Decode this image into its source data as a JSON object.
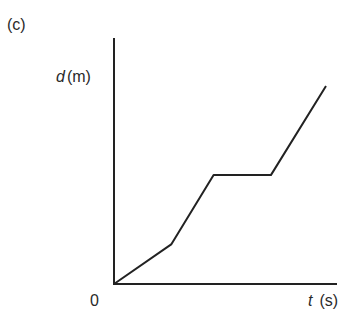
{
  "panel_label": "(c)",
  "chart_data": {
    "type": "line",
    "title": "",
    "xlabel_var": "t",
    "xlabel_unit": "(s)",
    "ylabel_var": "d",
    "ylabel_unit": "(m)",
    "origin_label": "0",
    "grid": false,
    "legend": null,
    "units": "relative (no tick values shown)",
    "x": [
      0,
      0.27,
      0.47,
      0.74,
      1.0
    ],
    "y": [
      0,
      0.2,
      0.55,
      0.55,
      1.0
    ],
    "xlim": [
      0,
      1.1
    ],
    "ylim": [
      0,
      1.25
    ],
    "segments": [
      "slow constant speed",
      "faster constant speed",
      "stationary (flat)",
      "fastest constant speed"
    ]
  }
}
